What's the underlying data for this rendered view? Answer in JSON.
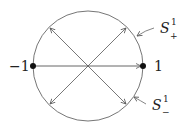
{
  "diagram": {
    "type": "unit-circle-antipodal-map",
    "circle": {
      "cx": 88,
      "cy": 66,
      "r": 55,
      "stroke": "#555555"
    },
    "points": [
      {
        "id": "minus-one",
        "label": "−1",
        "x": 33,
        "y": 66
      },
      {
        "id": "one",
        "label": "1",
        "x": 143,
        "y": 66
      }
    ],
    "labels": {
      "upper": {
        "base": "S",
        "sup": "1",
        "sub": "+"
      },
      "lower": {
        "base": "S",
        "sup": "1",
        "sub": "−"
      }
    },
    "arrows": [
      {
        "from": [
          33,
          66
        ],
        "to": [
          141,
          66
        ]
      },
      {
        "from": [
          88,
          66
        ],
        "to": [
          49,
          27
        ]
      },
      {
        "from": [
          88,
          66
        ],
        "to": [
          127,
          27
        ]
      },
      {
        "from": [
          88,
          66
        ],
        "to": [
          49,
          105
        ]
      },
      {
        "from": [
          88,
          66
        ],
        "to": [
          127,
          105
        ]
      }
    ],
    "colors": {
      "line": "#555555",
      "dot": "#111111",
      "text": "#222222"
    }
  }
}
